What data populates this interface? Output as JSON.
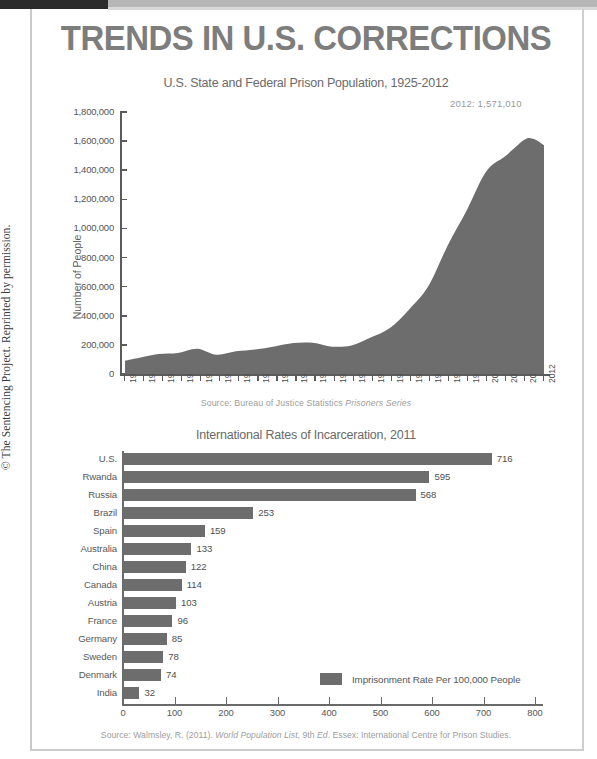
{
  "page": {
    "title": "TRENDS IN U.S. CORRECTIONS",
    "copyright": "© The Sentencing Project. Reprinted by permission."
  },
  "chart_data": [
    {
      "type": "area",
      "title": "U.S. State and Federal Prison Population, 1925-2012",
      "xlabel": "",
      "ylabel": "Number of People",
      "source": "Source: Bureau of Justice Statistics ",
      "source_italic": "Prisoners Series",
      "annotation": "2012: 1,571,010",
      "ylim": [
        0,
        1800000
      ],
      "yticks": [
        "0",
        "200,000",
        "400,000",
        "600,000",
        "800,000",
        "1,000,000",
        "1,200,000",
        "1,400,000",
        "1,600,000",
        "1,800,000"
      ],
      "ytick_values": [
        0,
        200000,
        400000,
        600000,
        800000,
        1000000,
        1200000,
        1400000,
        1600000,
        1800000
      ],
      "xlim": [
        1925,
        2012
      ],
      "xticks": [
        "1925",
        "1928",
        "1932",
        "1936",
        "1940",
        "1944",
        "1948",
        "1952",
        "1956",
        "1960",
        "1964",
        "1968",
        "1972",
        "1976",
        "1980",
        "1984",
        "1988",
        "1992",
        "1996",
        "2000",
        "2004",
        "2008",
        "2012"
      ],
      "x": [
        1925,
        1928,
        1932,
        1936,
        1940,
        1944,
        1948,
        1952,
        1956,
        1960,
        1964,
        1968,
        1972,
        1976,
        1980,
        1984,
        1988,
        1992,
        1996,
        2000,
        2004,
        2008,
        2010,
        2012
      ],
      "values": [
        91669,
        112000,
        137000,
        145038,
        173706,
        132456,
        155977,
        168233,
        189735,
        212953,
        214336,
        187914,
        196092,
        250042,
        315974,
        443398,
        603732,
        883593,
        1127528,
        1391261,
        1497100,
        1610446,
        1612395,
        1571010
      ],
      "grid": false,
      "legend": "none"
    },
    {
      "type": "bar",
      "orientation": "horizontal",
      "title": "International Rates of Incarceration, 2011",
      "xlabel": "",
      "ylabel": "",
      "source": "Source: Walmsley, R. (2011). ",
      "source_italic": "World Population List",
      "source_tail": ", 9th ",
      "source_italic2": "Ed",
      "source_tail2": ". Essex: International Centre for Prison Studies.",
      "legend_label": "Imprisonment Rate Per 100,000 People",
      "legend_position": "inside-bottom-right",
      "xlim": [
        0,
        800
      ],
      "xticks": [
        "0",
        "100",
        "200",
        "300",
        "400",
        "500",
        "600",
        "700",
        "800"
      ],
      "xtick_values": [
        0,
        100,
        200,
        300,
        400,
        500,
        600,
        700,
        800
      ],
      "categories": [
        "U.S.",
        "Rwanda",
        "Russia",
        "Brazil",
        "Spain",
        "Australia",
        "China",
        "Canada",
        "Austria",
        "France",
        "Germany",
        "Sweden",
        "Denmark",
        "India"
      ],
      "values": [
        716,
        595,
        568,
        253,
        159,
        133,
        122,
        114,
        103,
        96,
        85,
        78,
        74,
        32
      ],
      "grid": false
    }
  ],
  "colors": {
    "area_fill": "#6d6d6d",
    "bar_fill": "#6d6d6d",
    "title": "#7d7d7d",
    "axis": "#5b5b5b",
    "text": "#585858",
    "source_text": "#9d9d9d"
  }
}
